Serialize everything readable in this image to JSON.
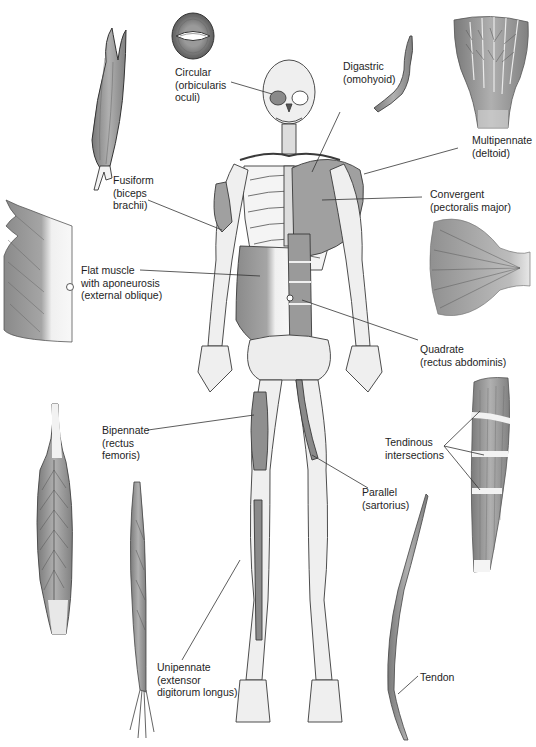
{
  "figure": {
    "colors": {
      "muscle_fill": "#9a9a9a",
      "muscle_dark": "#6e6e6e",
      "bone_fill": "#ececec",
      "outline": "#3a3a3a",
      "tendon": "#f4f4f4",
      "leader_line": "#333333"
    }
  },
  "labels": {
    "circular": {
      "line1": "Circular",
      "line2": "(orbicularis",
      "line3": "oculi)"
    },
    "digastric": {
      "line1": "Digastric",
      "line2": "(omohyoid)"
    },
    "multipennate": {
      "line1": "Multipennate",
      "line2": "(deltoid)"
    },
    "fusiform": {
      "line1": "Fusiform",
      "line2": "(biceps",
      "line3": "brachii)"
    },
    "convergent": {
      "line1": "Convergent",
      "line2": "(pectoralis major)"
    },
    "flat": {
      "line1": "Flat muscle",
      "line2": "with aponeurosis",
      "line3": "(external oblique)"
    },
    "quadrate": {
      "line1": "Quadrate",
      "line2": "(rectus abdominis)"
    },
    "bipennate": {
      "line1": "Bipennate",
      "line2": "(rectus",
      "line3": "femoris)"
    },
    "tendinous": {
      "line1": "Tendinous",
      "line2": "intersections"
    },
    "parallel": {
      "line1": "Parallel",
      "line2": "(sartorius)"
    },
    "unipennate": {
      "line1": "Unipennate",
      "line2": "(extensor",
      "line3": "digitorum longus)"
    },
    "tendon": {
      "line1": "Tendon"
    }
  }
}
